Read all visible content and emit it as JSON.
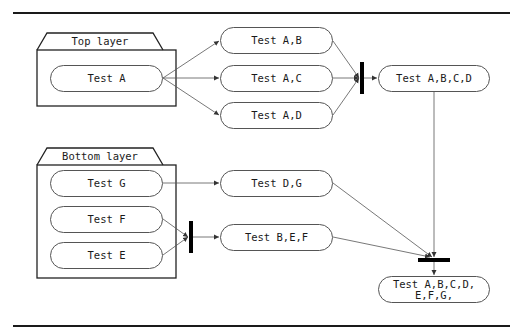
{
  "diagram": {
    "type": "activity-diagram",
    "layers": [
      {
        "id": "top",
        "label": "Top layer"
      },
      {
        "id": "bottom",
        "label": "Bottom layer"
      }
    ],
    "nodes": {
      "test_a": "Test A",
      "test_ab": "Test A,B",
      "test_ac": "Test A,C",
      "test_ad": "Test A,D",
      "test_abcd": "Test A,B,C,D",
      "test_g": "Test G",
      "test_f": "Test F",
      "test_e": "Test E",
      "test_dg": "Test D,G",
      "test_bef": "Test B,E,F",
      "test_all": "Test A,B,C,D,\nE,F,G,"
    },
    "edges": [
      [
        "test_a",
        "test_ab"
      ],
      [
        "test_a",
        "test_ac"
      ],
      [
        "test_a",
        "test_ad"
      ],
      [
        "test_ab",
        "join_top"
      ],
      [
        "test_ac",
        "join_top"
      ],
      [
        "test_ad",
        "join_top"
      ],
      [
        "join_top",
        "test_abcd"
      ],
      [
        "test_g",
        "test_dg"
      ],
      [
        "test_f",
        "join_bottom"
      ],
      [
        "test_e",
        "join_bottom"
      ],
      [
        "join_bottom",
        "test_bef"
      ],
      [
        "test_abcd",
        "join_final"
      ],
      [
        "test_dg",
        "join_final"
      ],
      [
        "test_bef",
        "join_final"
      ],
      [
        "join_final",
        "test_all"
      ]
    ],
    "colors": {
      "stroke": "#555555",
      "bar": "#000000",
      "text": "#1a1a1a",
      "background": "#ffffff"
    }
  }
}
